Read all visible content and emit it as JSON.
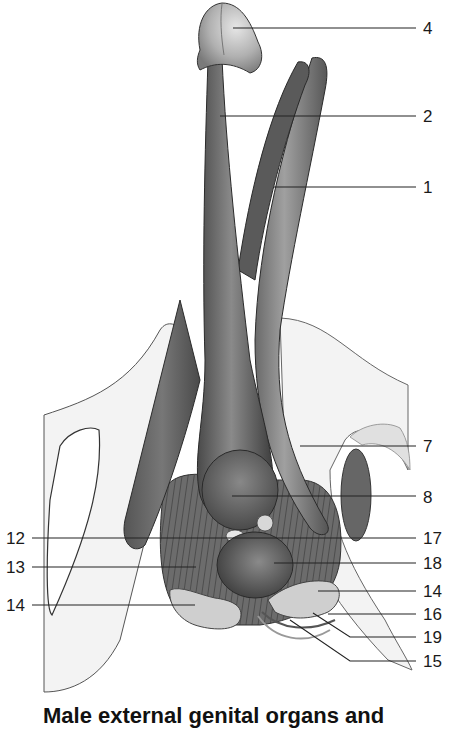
{
  "figure": {
    "caption": "Male external genital organs and",
    "labels_right": [
      {
        "id": "4",
        "y": 28
      },
      {
        "id": "2",
        "y": 116
      },
      {
        "id": "1",
        "y": 187
      },
      {
        "id": "7",
        "y": 446
      },
      {
        "id": "8",
        "y": 497
      },
      {
        "id": "17",
        "y": 538
      },
      {
        "id": "18",
        "y": 563
      },
      {
        "id": "14",
        "y": 591
      },
      {
        "id": "16",
        "y": 614
      },
      {
        "id": "19",
        "y": 637
      },
      {
        "id": "15",
        "y": 661
      }
    ],
    "labels_left": [
      {
        "id": "12",
        "y": 538
      },
      {
        "id": "13",
        "y": 567
      },
      {
        "id": "14",
        "y": 605
      }
    ],
    "colors": {
      "background": "#ffffff",
      "bone": "#f2f2f2",
      "bone_edge": "#9a9a9a",
      "corpus_dark": "#5e5e5e",
      "corpus_mid": "#7a7a7a",
      "glans": "#b8b8b8",
      "leader_line": "#222222"
    }
  }
}
